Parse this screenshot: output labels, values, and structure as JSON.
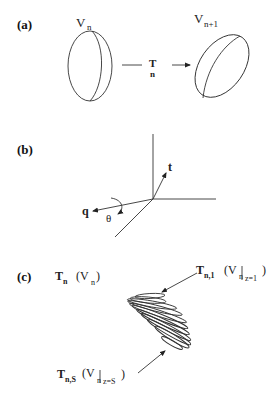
{
  "panels": {
    "a": {
      "label": "(a)",
      "left_volume_label": "V",
      "left_volume_sub": "n",
      "right_volume_label": "V",
      "right_volume_sub": "n+1",
      "transform_label": "T",
      "transform_sub": "n"
    },
    "b": {
      "label": "(b)",
      "axis_q_label": "q",
      "axis_t_label": "t",
      "angle_label": "θ"
    },
    "c": {
      "label": "(c)",
      "whole_T": "T",
      "whole_T_sub": "n",
      "whole_V": "(V",
      "whole_V_sub": "n",
      "whole_V_close": ")",
      "top_T": "T",
      "top_T_sub": "n,1",
      "top_V": "(V",
      "top_V_sub": "n",
      "top_cond": "z=1",
      "top_close": ")",
      "bottom_T": "T",
      "bottom_T_sub": "n,S",
      "bottom_V": "(V",
      "bottom_V_sub": "n",
      "bottom_cond": "z=S",
      "bottom_close": ")"
    }
  },
  "colors": {
    "line": "#333333",
    "background": "#ffffff"
  }
}
